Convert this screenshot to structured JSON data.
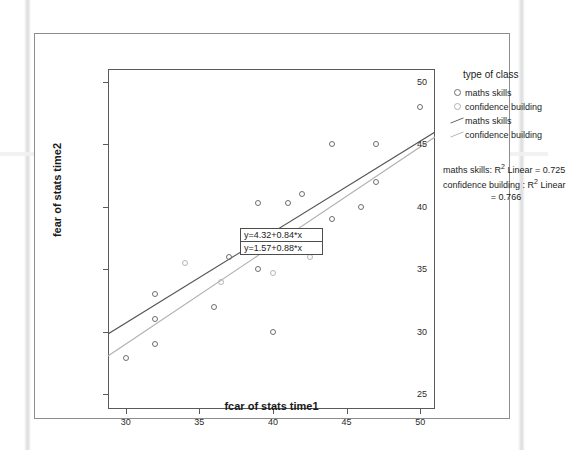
{
  "chart_data": {
    "type": "scatter",
    "title": "",
    "xlabel": "fcar of stats time1",
    "ylabel": "fear of stats time2",
    "xlim": [
      28.8,
      51.0
    ],
    "ylim": [
      23.8,
      51.0
    ],
    "xticks": [
      30,
      35,
      40,
      45,
      50
    ],
    "yticks": [
      25,
      30,
      35,
      40,
      45,
      50
    ],
    "grid": false,
    "legend_position": "right",
    "series": [
      {
        "name": "maths skills",
        "marker": "open-circle",
        "color": "#6e6e6e",
        "points": [
          {
            "x": 30.0,
            "y": 27.9
          },
          {
            "x": 32.0,
            "y": 31.0
          },
          {
            "x": 32.0,
            "y": 29.0
          },
          {
            "x": 32.0,
            "y": 33.0
          },
          {
            "x": 36.0,
            "y": 32.0
          },
          {
            "x": 37.0,
            "y": 36.0
          },
          {
            "x": 39.0,
            "y": 40.3
          },
          {
            "x": 39.0,
            "y": 35.0
          },
          {
            "x": 39.0,
            "y": 38.0
          },
          {
            "x": 40.0,
            "y": 30.0
          },
          {
            "x": 41.0,
            "y": 40.3
          },
          {
            "x": 42.0,
            "y": 41.0
          },
          {
            "x": 42.5,
            "y": 37.0
          },
          {
            "x": 44.0,
            "y": 39.0
          },
          {
            "x": 44.0,
            "y": 45.0
          },
          {
            "x": 46.0,
            "y": 40.0
          },
          {
            "x": 47.0,
            "y": 45.0
          },
          {
            "x": 47.0,
            "y": 42.0
          },
          {
            "x": 50.0,
            "y": 48.0
          }
        ]
      },
      {
        "name": "confidence building",
        "marker": "open-circle",
        "color": "#b4b4b4",
        "points": [
          {
            "x": 34.0,
            "y": 35.5
          },
          {
            "x": 36.5,
            "y": 34.0
          },
          {
            "x": 40.0,
            "y": 34.7
          },
          {
            "x": 42.5,
            "y": 36.0
          }
        ]
      }
    ],
    "fit_lines": [
      {
        "name": "maths skills",
        "equation": "y=4.32+0.84*x",
        "intercept": 4.32,
        "slope": 0.84,
        "r_squared": 0.725,
        "color": "#555555"
      },
      {
        "name": "confidence building",
        "equation": "y=1.57+0.88*x",
        "intercept": 1.57,
        "slope": 0.88,
        "r_squared": 0.766,
        "color": "#b0b0b0"
      }
    ],
    "annotations": {
      "equation_box": [
        "y=4.32+0.84*x",
        "y=1.57+0.88*x"
      ],
      "r_squared_text": [
        "maths skills: R² Linear = 0.725",
        "confidence building : R² Linear",
        "= 0.766"
      ]
    }
  },
  "legend": {
    "title": "type of class",
    "items": [
      {
        "label": "maths skills",
        "key": "marker-dark"
      },
      {
        "label": "confidence building",
        "key": "marker-light"
      },
      {
        "label": "maths skills",
        "key": "line-dark"
      },
      {
        "label": "confidence building",
        "key": "line-light"
      }
    ]
  },
  "rsquared_block": {
    "line1_prefix": "maths skills: R",
    "line1_sup": "2",
    "line1_suffix": " Linear = 0.725",
    "line2_prefix": "confidence building : R",
    "line2_sup": "2",
    "line2_suffix": " Linear",
    "line3": "= 0.766"
  },
  "axes": {
    "x_title": "fcar of stats time1",
    "y_title": "fear of stats time2",
    "x_tick_labels": [
      "30",
      "35",
      "40",
      "45",
      "50"
    ],
    "y_tick_labels": [
      "50",
      "45",
      "40",
      "35",
      "30",
      "25"
    ]
  },
  "equation_box": {
    "line1": "y=4.32+0.84*x",
    "line2": "y=1.57+0.88*x"
  }
}
